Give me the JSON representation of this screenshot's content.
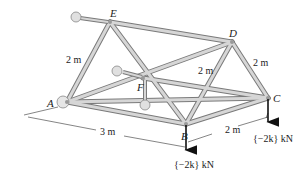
{
  "diagram": {
    "type": "space-truss",
    "joints": {
      "A": {
        "label": "A",
        "x": 67,
        "y": 102
      },
      "B": {
        "label": "B",
        "x": 186,
        "y": 124
      },
      "C": {
        "label": "C",
        "x": 268,
        "y": 98
      },
      "D": {
        "label": "D",
        "x": 232,
        "y": 42
      },
      "E": {
        "label": "E",
        "x": 110,
        "y": 22
      },
      "F": {
        "label": "F",
        "x": 143,
        "y": 78
      }
    },
    "members": [
      [
        "A",
        "E"
      ],
      [
        "E",
        "D"
      ],
      [
        "E",
        "B"
      ],
      [
        "D",
        "B"
      ],
      [
        "D",
        "C"
      ],
      [
        "A",
        "B"
      ],
      [
        "B",
        "C"
      ],
      [
        "A",
        "D"
      ],
      [
        "A",
        "F"
      ],
      [
        "F",
        "C"
      ],
      [
        "E",
        "F"
      ]
    ],
    "dimensions": {
      "AE": "2 m",
      "DF": "2 m",
      "DC": "2 m",
      "AB": "3 m",
      "BC": "2 m"
    },
    "loads": {
      "B": "{−2k} kN",
      "C": "{−2k} kN"
    },
    "colors": {
      "member": "#c8c8c8",
      "member_edge": "#7a7a7a",
      "support": "#d9d9d9",
      "arrow": "#111111",
      "text": "#222222"
    }
  }
}
